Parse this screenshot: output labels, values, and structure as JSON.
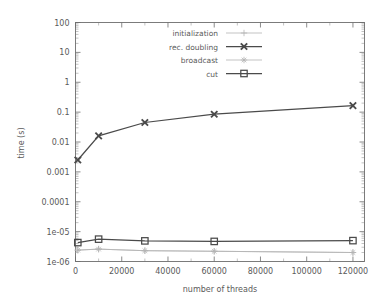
{
  "chart_data": {
    "type": "line",
    "title": "",
    "xlabel": "number of threads",
    "ylabel": "time (s)",
    "xlim": [
      0,
      125000
    ],
    "ylim": [
      1e-06,
      100
    ],
    "yscale": "log",
    "xscale": "linear",
    "grid": false,
    "legend_position": "top-center",
    "xticks": [
      0,
      20000,
      40000,
      60000,
      80000,
      100000,
      120000
    ],
    "xtick_labels": [
      "0",
      "20000",
      "40000",
      "60000",
      "80000",
      "100000",
      "120000"
    ],
    "yticks": [
      1e-06,
      1e-05,
      0.0001,
      0.001,
      0.01,
      0.1,
      1,
      10,
      100
    ],
    "ytick_labels": [
      "1e-06",
      "1e-05",
      "0.0001",
      "0.001",
      "0.01",
      "0.1",
      "1",
      "10",
      "100"
    ],
    "series": [
      {
        "name": "initialization",
        "marker": "plus",
        "color": "#b4b4b4",
        "x": [
          1000,
          10000,
          30000,
          60000,
          120000
        ],
        "values": [
          2.4e-06,
          2.6e-06,
          2.3e-06,
          2.2e-06,
          2e-06
        ]
      },
      {
        "name": "rec. doubling",
        "marker": "cross",
        "color": "#4a4a4a",
        "x": [
          1000,
          10000,
          30000,
          60000,
          120000
        ],
        "values": [
          0.0025,
          0.016,
          0.045,
          0.085,
          0.165
        ]
      },
      {
        "name": "broadcast",
        "marker": "star",
        "color": "#b4b4b4",
        "x": [
          1000,
          10000,
          30000,
          60000,
          120000
        ],
        "values": [
          2.4e-06,
          2.6e-06,
          2.3e-06,
          2.2e-06,
          2e-06
        ]
      },
      {
        "name": "cut",
        "marker": "square",
        "color": "#4a4a4a",
        "x": [
          1000,
          10000,
          30000,
          60000,
          120000
        ],
        "values": [
          4.3e-06,
          5.6e-06,
          4.9e-06,
          4.7e-06,
          5e-06
        ]
      }
    ]
  },
  "axes": {
    "x_title": "number of threads",
    "y_title": "time (s)"
  },
  "legend": {
    "items": [
      {
        "label": "initialization"
      },
      {
        "label": "rec. doubling"
      },
      {
        "label": "broadcast"
      },
      {
        "label": "cut"
      }
    ]
  },
  "colors": {
    "dark": "#4a4a4a",
    "light": "#b4b4b4",
    "frame": "#6e6e6e",
    "background": "#ffffff"
  }
}
